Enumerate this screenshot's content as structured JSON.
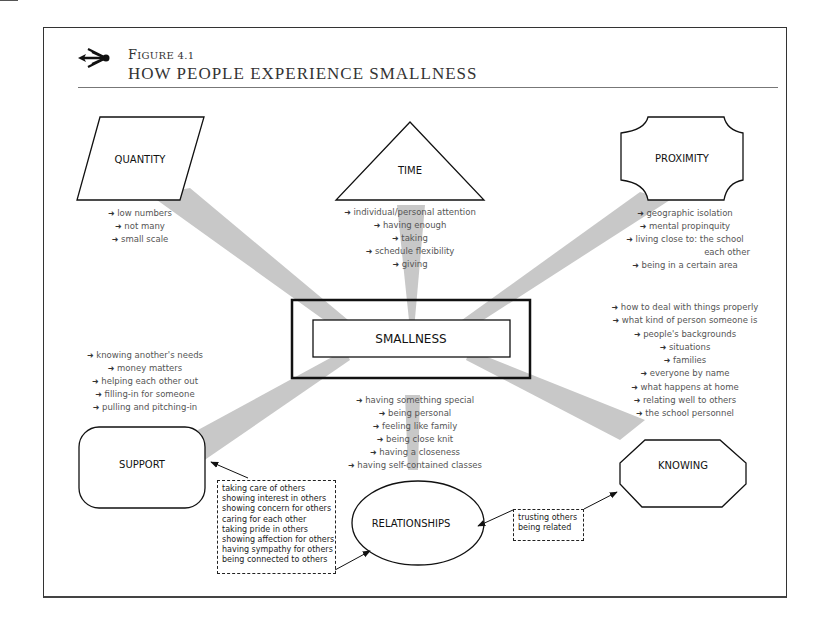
{
  "figure": {
    "label_prefix": "F",
    "label_rest": "IGURE 4.1",
    "title": "HOW PEOPLE EXPERIENCE SMALLNESS",
    "logo_icon": "arrow-burst-icon"
  },
  "center": {
    "label": "SMALLNESS"
  },
  "nodes": {
    "quantity": {
      "label": "QUANTITY",
      "shape": "parallelogram"
    },
    "time": {
      "label": "TIME",
      "shape": "triangle"
    },
    "proximity": {
      "label": "PROXIMITY",
      "shape": "notched-rectangle"
    },
    "support": {
      "label": "SUPPORT",
      "shape": "rounded-rectangle"
    },
    "relationships": {
      "label": "RELATIONSHIPS",
      "shape": "ellipse"
    },
    "knowing": {
      "label": "KNOWING",
      "shape": "octagon"
    }
  },
  "lists": {
    "quantity": [
      "low numbers",
      "not many",
      "small scale"
    ],
    "time": [
      "individual/personal attention",
      "having enough",
      "taking",
      "schedule flexibility",
      "giving"
    ],
    "proximity": [
      "geographic isolation",
      "mental propinquity",
      "living close to: the school",
      "being in a certain area"
    ],
    "proximity_continuation": "each other",
    "support": [
      "knowing another's needs",
      "money matters",
      "helping each other out",
      "filling-in for someone",
      "pulling and pitching-in"
    ],
    "relationships": [
      "having something special",
      "being personal",
      "feeling like family",
      "being close knit",
      "having a closeness",
      "having self-contained classes"
    ],
    "knowing": [
      "how to deal with things properly",
      "what kind of person someone is",
      "people's backgrounds",
      "situations",
      "families",
      "everyone by name",
      "what happens at home",
      "relating well to others",
      "the school personnel"
    ]
  },
  "callouts": {
    "support_relationships": [
      "taking care of others",
      "showing interest in others",
      "showing concern for others",
      "caring for each other",
      "taking pride in others",
      "showing affection for others",
      "having sympathy for others",
      "being connected to others"
    ],
    "relationships_knowing": [
      "trusting others",
      "being related"
    ]
  },
  "colors": {
    "beam": "#c8c8c8",
    "stroke": "#111111",
    "list_text": "#555555"
  }
}
